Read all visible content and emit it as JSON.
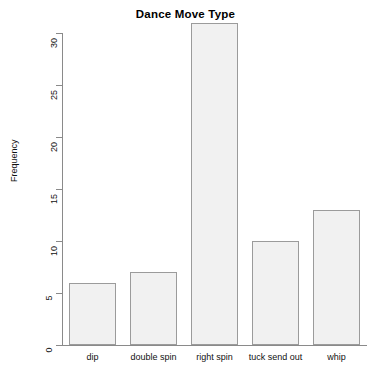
{
  "chart_data": {
    "type": "bar",
    "title": "Dance Move Type",
    "xlabel": "",
    "ylabel": "Frequency",
    "categories": [
      "dip",
      "double spin",
      "right spin",
      "tuck send out",
      "whip"
    ],
    "values": [
      6,
      7,
      31,
      10,
      13
    ],
    "ylim": [
      0,
      31
    ],
    "yticks": [
      0,
      5,
      10,
      15,
      20,
      25,
      30
    ],
    "ytick_labels": [
      "0",
      "5",
      "10",
      "15",
      "20",
      "25",
      "30"
    ],
    "grid": false,
    "legend": false,
    "legend_position": "none",
    "bar_fill_color": "#f1f1f1",
    "bar_border_color": "#9b9b9b",
    "axis_color": "#8a8a8a",
    "background_color": "#ffffff",
    "text_color": "#000000"
  }
}
